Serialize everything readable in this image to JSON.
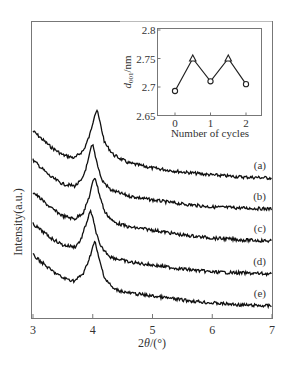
{
  "chart_data": [
    {
      "id": "main",
      "type": "line",
      "title": "",
      "xlabel": "2θ/(°)",
      "ylabel": "Intensity(a.u.)",
      "xlim": [
        3,
        7
      ],
      "x_ticks": [
        3,
        4,
        5,
        6,
        7
      ],
      "x_tick_labels": [
        "3",
        "4",
        "5",
        "6",
        "7"
      ],
      "y_ticks": [],
      "grid": false,
      "legend": "inline labels on right",
      "series": [
        {
          "name": "(a)",
          "peak_2theta": 4.07,
          "offset_rank": 1,
          "points": [
            [
              3.0,
              131
            ],
            [
              3.3,
              147
            ],
            [
              3.5,
              155
            ],
            [
              3.7,
              158
            ],
            [
              3.85,
              150
            ],
            [
              3.95,
              135
            ],
            [
              4.03,
              115
            ],
            [
              4.07,
              110
            ],
            [
              4.12,
              122
            ],
            [
              4.2,
              143
            ],
            [
              4.35,
              155
            ],
            [
              4.6,
              163
            ],
            [
              5.0,
              168
            ],
            [
              5.5,
              172
            ],
            [
              6.0,
              175
            ],
            [
              6.5,
              177
            ],
            [
              7.0,
              178
            ]
          ]
        },
        {
          "name": "(b)",
          "peak_2theta": 4.0,
          "offset_rank": 2,
          "points": [
            [
              3.0,
              160
            ],
            [
              3.3,
              177
            ],
            [
              3.5,
              184
            ],
            [
              3.7,
              186
            ],
            [
              3.82,
              180
            ],
            [
              3.92,
              162
            ],
            [
              3.97,
              148
            ],
            [
              4.0,
              145
            ],
            [
              4.06,
              160
            ],
            [
              4.15,
              180
            ],
            [
              4.3,
              190
            ],
            [
              4.6,
              196
            ],
            [
              5.0,
              200
            ],
            [
              5.5,
              204
            ],
            [
              6.0,
              207
            ],
            [
              6.5,
              208
            ],
            [
              7.0,
              209
            ]
          ]
        },
        {
          "name": "(c)",
          "peak_2theta": 4.04,
          "offset_rank": 3,
          "points": [
            [
              3.0,
              192
            ],
            [
              3.3,
              208
            ],
            [
              3.5,
              216
            ],
            [
              3.7,
              219
            ],
            [
              3.85,
              212
            ],
            [
              3.95,
              195
            ],
            [
              4.01,
              180
            ],
            [
              4.04,
              177
            ],
            [
              4.1,
              192
            ],
            [
              4.2,
              212
            ],
            [
              4.35,
              222
            ],
            [
              4.6,
              227
            ],
            [
              5.0,
              230
            ],
            [
              5.5,
              235
            ],
            [
              6.0,
              238
            ],
            [
              6.5,
              240
            ],
            [
              7.0,
              241
            ]
          ]
        },
        {
          "name": "(d)",
          "peak_2theta": 3.97,
          "offset_rank": 4,
          "points": [
            [
              3.0,
              224
            ],
            [
              3.3,
              238
            ],
            [
              3.5,
              245
            ],
            [
              3.7,
              247
            ],
            [
              3.8,
              240
            ],
            [
              3.9,
              222
            ],
            [
              3.95,
              213
            ],
            [
              3.97,
              211
            ],
            [
              4.03,
              226
            ],
            [
              4.12,
              246
            ],
            [
              4.3,
              257
            ],
            [
              4.6,
              262
            ],
            [
              5.0,
              265
            ],
            [
              5.5,
              269
            ],
            [
              6.0,
              272
            ],
            [
              6.5,
              273
            ],
            [
              7.0,
              274
            ]
          ]
        },
        {
          "name": "(e)",
          "peak_2theta": 4.04,
          "offset_rank": 5,
          "points": [
            [
              3.0,
              255
            ],
            [
              3.3,
              270
            ],
            [
              3.5,
              278
            ],
            [
              3.7,
              281
            ],
            [
              3.85,
              273
            ],
            [
              3.95,
              257
            ],
            [
              4.01,
              245
            ],
            [
              4.04,
              242
            ],
            [
              4.1,
              258
            ],
            [
              4.2,
              278
            ],
            [
              4.35,
              289
            ],
            [
              4.6,
              293
            ],
            [
              5.0,
              296
            ],
            [
              5.5,
              300
            ],
            [
              6.0,
              303
            ],
            [
              6.5,
              305
            ],
            [
              7.0,
              306
            ]
          ]
        }
      ],
      "annotations": [
        "(a)",
        "(b)",
        "(c)",
        "(d)",
        "(e)"
      ]
    },
    {
      "id": "inset",
      "type": "line",
      "title": "",
      "xlabel": "Number of cycles",
      "ylabel": "d001/nm",
      "xlim": [
        -0.5,
        2.5
      ],
      "ylim": [
        2.65,
        2.8
      ],
      "x_ticks": [
        0,
        1,
        2
      ],
      "x_tick_labels": [
        "0",
        "1",
        "2"
      ],
      "y_ticks": [
        2.65,
        2.7,
        2.75,
        2.8
      ],
      "y_tick_labels": [
        "2.65",
        "2.7",
        "2.75",
        "2.8"
      ],
      "grid": false,
      "series": [
        {
          "name": "d001",
          "x": [
            0,
            0.5,
            1,
            1.5,
            2
          ],
          "values": [
            2.693,
            2.75,
            2.71,
            2.75,
            2.705
          ],
          "markers": [
            "circle",
            "triangle",
            "circle",
            "triangle",
            "circle"
          ]
        }
      ]
    }
  ],
  "labels": {
    "main_xlabel_prefix": "2",
    "main_xlabel_theta": "θ",
    "main_xlabel_suffix": "/(°)",
    "main_ylabel": "Intensity(a.u.)",
    "inset_ylabel_d": "d",
    "inset_ylabel_sub": "001",
    "inset_ylabel_unit": "/nm",
    "inset_xlabel": "Number of cycles"
  },
  "colors": {
    "axis": "#666666",
    "trace": "#111111",
    "text": "#333333"
  }
}
